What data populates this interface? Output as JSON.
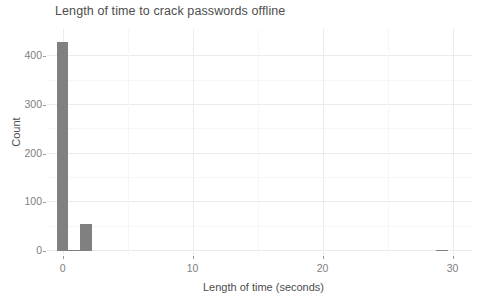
{
  "chart_data": {
    "type": "bar",
    "title": "Length of time to crack passwords offline",
    "xlabel": "Length of time (seconds)",
    "ylabel": "Count",
    "xlim": [
      -1.2,
      31.5
    ],
    "ylim": [
      0,
      440
    ],
    "xticks": [
      0,
      10,
      20,
      30
    ],
    "xtick_labels": [
      "0",
      "10",
      "20",
      "30"
    ],
    "yticks": [
      0,
      100,
      200,
      300,
      400
    ],
    "ytick_labels": [
      "0",
      "100",
      "200",
      "300",
      "400"
    ],
    "x_minor_ticks": [
      5,
      15,
      25
    ],
    "y_minor_ticks": [
      50,
      150,
      250,
      350
    ],
    "grid": true,
    "legend": "none",
    "bar_color": "#808080",
    "bin_width": 0.9,
    "x": [
      0.0,
      0.9,
      1.8,
      29.2
    ],
    "values": [
      430,
      3,
      55,
      1
    ],
    "bars": [
      {
        "x": 0.0,
        "count": 430
      },
      {
        "x": 0.9,
        "count": 3
      },
      {
        "x": 1.8,
        "count": 55
      },
      {
        "x": 29.2,
        "count": 1
      }
    ]
  },
  "colors": {
    "background": "#ffffff",
    "bar": "#808080",
    "grid_major": "#ebebeb",
    "grid_minor": "#f6f6f6",
    "title_text": "#4d4d4d",
    "axis_text": "#808080"
  }
}
